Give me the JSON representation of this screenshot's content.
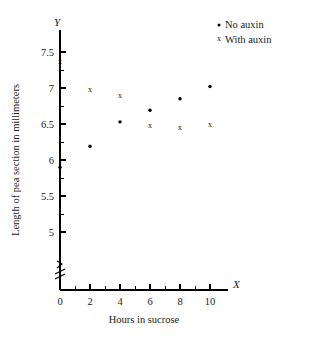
{
  "chart_data": {
    "type": "scatter",
    "title": "",
    "xlabel": "Hours in sucrose",
    "ylabel": "Length of pea section in millimeters",
    "x_axis_name": "X",
    "y_axis_name": "Y",
    "xlim": [
      0,
      10.6
    ],
    "ylim": [
      4.75,
      7.75
    ],
    "y_axis_break": true,
    "grid": false,
    "legend_position": "top-right",
    "x_ticks": [
      0,
      1,
      2,
      3,
      4,
      5,
      6,
      7,
      8,
      9,
      10
    ],
    "x_tick_labels": [
      "0",
      "",
      "2",
      "",
      "4",
      "",
      "6",
      "",
      "8",
      "",
      "10"
    ],
    "y_ticks": [
      5,
      5.25,
      5.5,
      5.75,
      6,
      6.25,
      6.5,
      6.75,
      7,
      7.25,
      7.5
    ],
    "y_tick_labels": [
      "5",
      "",
      "5.5",
      "",
      "6",
      "",
      "6.5",
      "",
      "7",
      "",
      "7.5"
    ],
    "series": [
      {
        "name": "No auxin",
        "marker": "dot",
        "x": [
          0,
          2,
          4,
          6,
          8,
          10
        ],
        "y": [
          5.9,
          6.19,
          6.53,
          6.69,
          6.85,
          7.02
        ]
      },
      {
        "name": "With auxin",
        "marker": "x",
        "x": [
          0,
          2,
          4,
          6,
          8,
          10
        ],
        "y": [
          7.37,
          6.99,
          6.9,
          6.48,
          6.46,
          6.5
        ]
      }
    ]
  },
  "legend": {
    "entries": [
      {
        "label": "No auxin",
        "glyph": "dot"
      },
      {
        "label": "With auxin",
        "glyph": "x"
      }
    ]
  }
}
